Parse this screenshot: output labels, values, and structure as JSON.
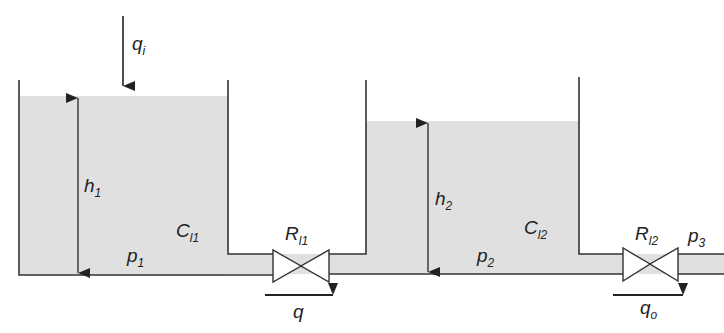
{
  "diagram": {
    "colors": {
      "liquid": "#e0e0e0",
      "line": "#333333",
      "background": "#ffffff"
    },
    "inflow": {
      "symbol": "q",
      "subscript": "i"
    },
    "tank1": {
      "height_label": {
        "symbol": "h",
        "subscript": "1"
      },
      "capacitance_label": {
        "symbol": "C",
        "subscript": "l1"
      },
      "pressure_label": {
        "symbol": "p",
        "subscript": "1"
      }
    },
    "valve1": {
      "symbol": "R",
      "subscript": "l1"
    },
    "flow1": {
      "symbol": "q",
      "subscript": ""
    },
    "tank2": {
      "height_label": {
        "symbol": "h",
        "subscript": "2"
      },
      "capacitance_label": {
        "symbol": "C",
        "subscript": "l2"
      },
      "pressure_label": {
        "symbol": "p",
        "subscript": "2"
      }
    },
    "valve2": {
      "symbol": "R",
      "subscript": "l2"
    },
    "outlet_pressure": {
      "symbol": "p",
      "subscript": "3"
    },
    "outflow": {
      "symbol": "q",
      "subscript": "o"
    }
  }
}
